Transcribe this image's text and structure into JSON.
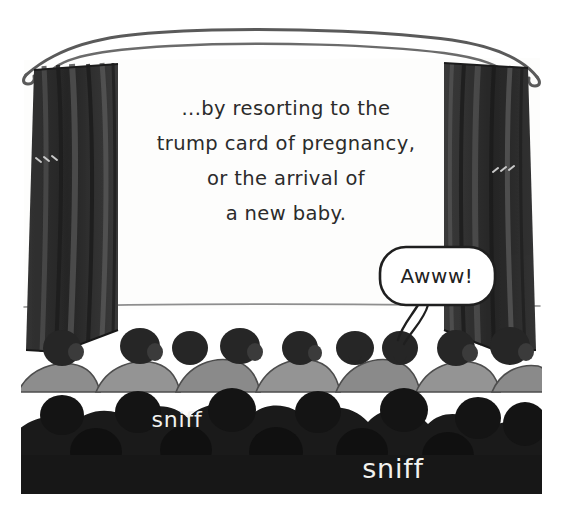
{
  "comic": {
    "scene_name": "cinema-audience",
    "screen": {
      "lines": [
        "...by resorting to the",
        "trump card of pregnancy,",
        "or the arrival of",
        "a new baby."
      ]
    },
    "speech_bubble": {
      "text": "Awww!"
    },
    "sound_effects": [
      {
        "text": "sniff"
      },
      {
        "text": "sniff"
      }
    ],
    "colors": {
      "paper": "#ffffff",
      "screen": "#fdfdfc",
      "curtain_dark": "#2e2e2e",
      "curtain_fold": "#4a4a4a",
      "seat_gray": "#8d8d8d",
      "head_dark": "#262626",
      "front_row": "#1a1a1a",
      "ink": "#2b2b2b",
      "sfx_text": "#f2f2ef"
    },
    "labels": {
      "projection_screen": "projection screen",
      "left_curtain": "left curtain",
      "right_curtain": "right curtain",
      "valance_rail": "curtain rail",
      "back_row": "back row of audience",
      "front_row": "front row of audience"
    }
  }
}
